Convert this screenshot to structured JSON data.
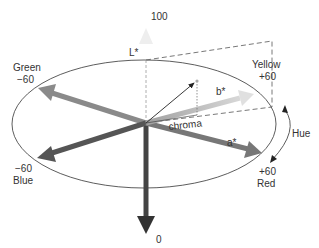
{
  "diagram": {
    "axes": {
      "lightness": {
        "name": "L*",
        "top_value": "100",
        "bottom_value": "0"
      },
      "a_star": {
        "name": "a*"
      },
      "b_star": {
        "name": "b*"
      }
    },
    "directions": {
      "green": {
        "name": "Green",
        "value": "−60"
      },
      "yellow": {
        "name": "Yellow",
        "value": "+60"
      },
      "blue": {
        "value": "−60",
        "name": "Blue"
      },
      "red": {
        "value": "+60",
        "name": "Red"
      }
    },
    "labels": {
      "chroma": "chroma",
      "hue": "Hue"
    },
    "colors": {
      "axis_dark": "#555555",
      "axis_mid": "#888888",
      "axis_light": "#cccccc",
      "line": "#333333"
    }
  }
}
